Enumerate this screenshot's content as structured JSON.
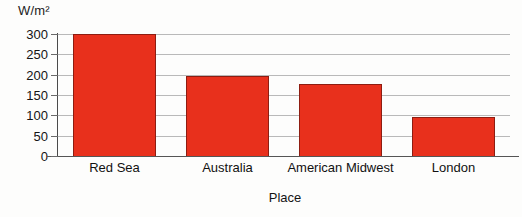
{
  "chart_data": {
    "type": "bar",
    "title": "",
    "categories": [
      "Red Sea",
      "Australia",
      "American Midwest",
      "London"
    ],
    "values": [
      300,
      197,
      178,
      95
    ],
    "series": [
      {
        "name": "Solar irradiance",
        "values": [
          300,
          197,
          178,
          95
        ]
      }
    ],
    "xlabel": "Place",
    "ylabel": "W/m²",
    "ylim": [
      0,
      300
    ],
    "ytick_labels": [
      "0",
      "50",
      "100",
      "150",
      "200",
      "250",
      "300"
    ],
    "ytick_values": [
      0,
      50,
      100,
      150,
      200,
      250,
      300
    ],
    "grid": true,
    "legend": false,
    "bar_color": "#e8301c",
    "bar_edge_color": "#8e1d11",
    "gridline_color": "#b9b9b9",
    "axis_color": "#4a4a4a",
    "background_color": "#fdfdfc"
  }
}
